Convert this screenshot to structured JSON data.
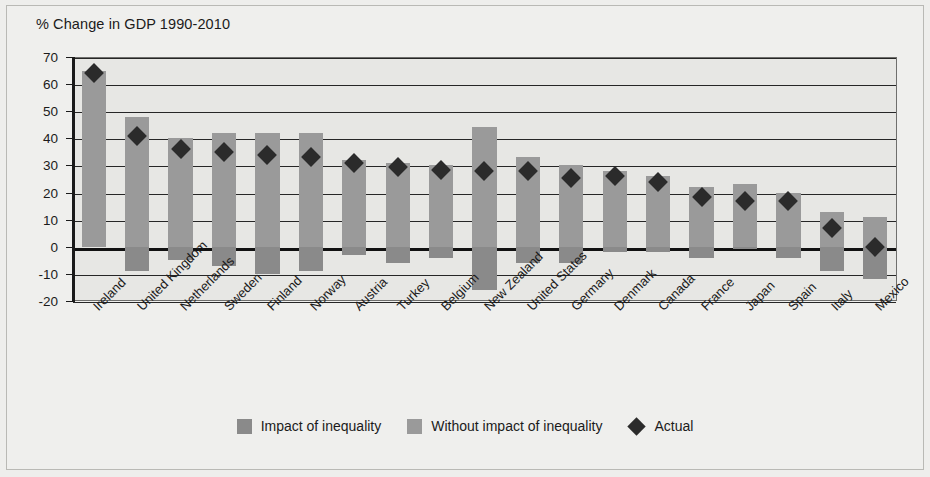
{
  "chart_data": {
    "type": "bar",
    "title": "% Change in GDP 1990-2010",
    "xlabel": "",
    "ylabel": "",
    "ylim": [
      -20,
      70
    ],
    "ytick_step": 10,
    "yticks": [
      70,
      60,
      50,
      40,
      30,
      20,
      10,
      0,
      -10,
      -20
    ],
    "grid": true,
    "legend_position": "bottom",
    "stacked": true,
    "categories": [
      "Ireland",
      "United Kingdom",
      "Netherlands",
      "Sweden",
      "Finland",
      "Norway",
      "Austria",
      "Turkey",
      "Belgium",
      "New Zealand",
      "United States",
      "Germany",
      "Denmark",
      "Canada",
      "France",
      "Japan",
      "Spain",
      "Italy",
      "Mexico"
    ],
    "series": [
      {
        "name": "Without impact of inequality",
        "role": "bar-top",
        "values": [
          65,
          48,
          40,
          42,
          42,
          42,
          32,
          31,
          30,
          44,
          33,
          30,
          28,
          26,
          22,
          23,
          20,
          13,
          11
        ]
      },
      {
        "name": "Impact of inequality",
        "role": "bar-bottom",
        "values": [
          0,
          -9,
          -5,
          -7,
          -10,
          -9,
          -3,
          -6,
          -4,
          -16,
          -6,
          -6,
          -2,
          -2,
          -4,
          -1,
          -4,
          -9,
          -12
        ]
      },
      {
        "name": "Actual",
        "role": "marker-diamond",
        "values": [
          64,
          41,
          36,
          35,
          34,
          33,
          31,
          29.5,
          28.5,
          28,
          28,
          25.5,
          26,
          24,
          18.5,
          17,
          17,
          7,
          0
        ]
      }
    ]
  },
  "legend": {
    "items": [
      {
        "label": "Impact of inequality",
        "swatch": "dark-gray-square",
        "color": "#8a8a8a"
      },
      {
        "label": "Without impact of inequality",
        "swatch": "light-gray-square",
        "color": "#9a9a9a"
      },
      {
        "label": "Actual",
        "swatch": "black-diamond",
        "color": "#2b2b2b"
      }
    ]
  }
}
